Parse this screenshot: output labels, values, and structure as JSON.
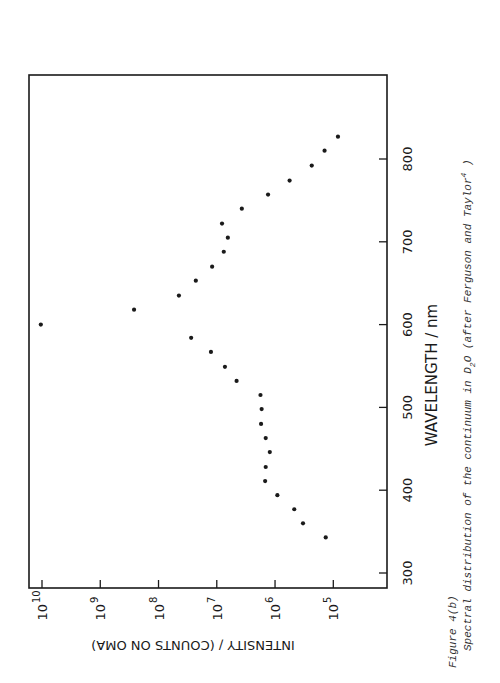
{
  "figure": {
    "label": "Figure 4(b)",
    "caption_prefix": "Spectral distribution of the continuum in D",
    "caption_sub": "2",
    "caption_mid": "O (after Ferguson and Taylor",
    "caption_sup": "4",
    "caption_suffix": " )"
  },
  "chart_data": {
    "type": "scatter",
    "xlabel": "WAVELENGTH / nm",
    "ylabel": "INTENSITY / (COUNTS ON OMA)",
    "xlim": [
      300,
      860
    ],
    "ylim_log10": [
      4.4,
      10.2
    ],
    "yscale": "log",
    "grid": false,
    "legend": null,
    "orientation_note": "figure printed rotated 90 degrees counter-clockwise",
    "x_ticks": [
      300,
      400,
      500,
      600,
      700,
      800
    ],
    "y_ticks": [
      {
        "label": "10^10",
        "base": "10",
        "exp": "10",
        "log10": 10
      },
      {
        "label": "10^9",
        "base": "10",
        "exp": "9",
        "log10": 9
      },
      {
        "label": "10^8",
        "base": "10",
        "exp": "8",
        "log10": 8
      },
      {
        "label": "10^7",
        "base": "10",
        "exp": "7",
        "log10": 7
      },
      {
        "label": "10^6",
        "base": "10",
        "exp": "6",
        "log10": 6
      },
      {
        "label": "10^5",
        "base": "10",
        "exp": "5",
        "log10": 5
      }
    ],
    "series": [
      {
        "name": "D2O continuum",
        "points": [
          {
            "wavelength_nm": 343,
            "log10_intensity": 5.13
          },
          {
            "wavelength_nm": 360,
            "log10_intensity": 5.52
          },
          {
            "wavelength_nm": 377,
            "log10_intensity": 5.67
          },
          {
            "wavelength_nm": 394,
            "log10_intensity": 5.96
          },
          {
            "wavelength_nm": 411,
            "log10_intensity": 6.17
          },
          {
            "wavelength_nm": 428,
            "log10_intensity": 6.16
          },
          {
            "wavelength_nm": 446,
            "log10_intensity": 6.09
          },
          {
            "wavelength_nm": 463,
            "log10_intensity": 6.16
          },
          {
            "wavelength_nm": 480,
            "log10_intensity": 6.24
          },
          {
            "wavelength_nm": 498,
            "log10_intensity": 6.23
          },
          {
            "wavelength_nm": 515,
            "log10_intensity": 6.25
          },
          {
            "wavelength_nm": 532,
            "log10_intensity": 6.66
          },
          {
            "wavelength_nm": 549,
            "log10_intensity": 6.86
          },
          {
            "wavelength_nm": 567,
            "log10_intensity": 7.1
          },
          {
            "wavelength_nm": 584,
            "log10_intensity": 7.44
          },
          {
            "wavelength_nm": 600,
            "log10_intensity": 10.02
          },
          {
            "wavelength_nm": 618,
            "log10_intensity": 8.42
          },
          {
            "wavelength_nm": 635,
            "log10_intensity": 7.65
          },
          {
            "wavelength_nm": 653,
            "log10_intensity": 7.36
          },
          {
            "wavelength_nm": 670,
            "log10_intensity": 7.08
          },
          {
            "wavelength_nm": 688,
            "log10_intensity": 6.88
          },
          {
            "wavelength_nm": 705,
            "log10_intensity": 6.81
          },
          {
            "wavelength_nm": 722,
            "log10_intensity": 6.91
          },
          {
            "wavelength_nm": 740,
            "log10_intensity": 6.57
          },
          {
            "wavelength_nm": 757,
            "log10_intensity": 6.12
          },
          {
            "wavelength_nm": 774,
            "log10_intensity": 5.75
          },
          {
            "wavelength_nm": 792,
            "log10_intensity": 5.37
          },
          {
            "wavelength_nm": 810,
            "log10_intensity": 5.15
          },
          {
            "wavelength_nm": 827,
            "log10_intensity": 4.92
          }
        ]
      }
    ]
  },
  "colors": {
    "ink": "#1a1a1a",
    "caption": "#333333",
    "background": "#ffffff"
  }
}
